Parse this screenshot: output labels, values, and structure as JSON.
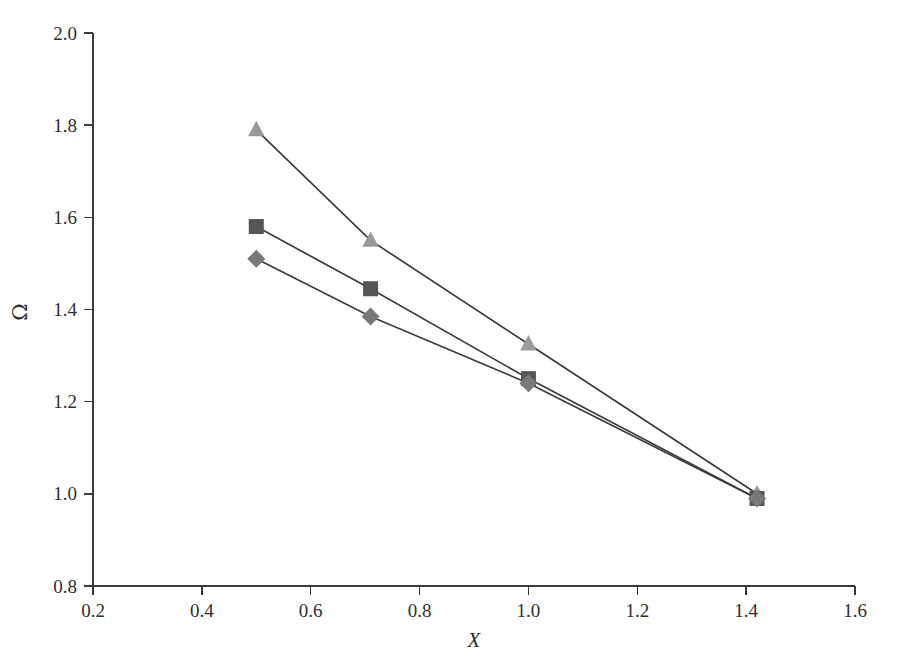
{
  "chart_data": {
    "type": "line",
    "title": "",
    "subtitle": "",
    "xlabel": "X",
    "ylabel": "Ω",
    "xlim": [
      0.2,
      1.6
    ],
    "ylim": [
      0.8,
      2.0
    ],
    "xticks": [
      "0.2",
      "0.4",
      "0.6",
      "0.8",
      "1.0",
      "1.2",
      "1.4",
      "1.6"
    ],
    "xtick_values": [
      0.2,
      0.4,
      0.6,
      0.8,
      1.0,
      1.2,
      1.4,
      1.6
    ],
    "yticks": [
      "0.8",
      "1.0",
      "1.2",
      "1.4",
      "1.6",
      "1.8",
      "2.0"
    ],
    "ytick_values": [
      0.8,
      1.0,
      1.2,
      1.4,
      1.6,
      1.8,
      2.0
    ],
    "grid": false,
    "legend": "none",
    "x": [
      0.5,
      0.71,
      1.0,
      1.42
    ],
    "series": [
      {
        "name": "triangle-series",
        "marker": "triangle",
        "color": "#9a9a9a",
        "line_color": "#3c3c3c",
        "values": [
          1.79,
          1.55,
          1.325,
          1.0
        ]
      },
      {
        "name": "square-series",
        "marker": "square",
        "color": "#565656",
        "line_color": "#3c3c3c",
        "values": [
          1.58,
          1.445,
          1.25,
          0.99
        ]
      },
      {
        "name": "diamond-series",
        "marker": "diamond",
        "color": "#787878",
        "line_color": "#3c3c3c",
        "values": [
          1.51,
          1.385,
          1.24,
          0.99
        ]
      }
    ],
    "annotations": []
  },
  "axes": {
    "x_axis_title": "X",
    "y_axis_title": "Ω"
  },
  "colors": {
    "axis": "#3a3a3a",
    "text": "#2f2f2f",
    "line": "#3c3c3c",
    "background": "#ffffff"
  }
}
